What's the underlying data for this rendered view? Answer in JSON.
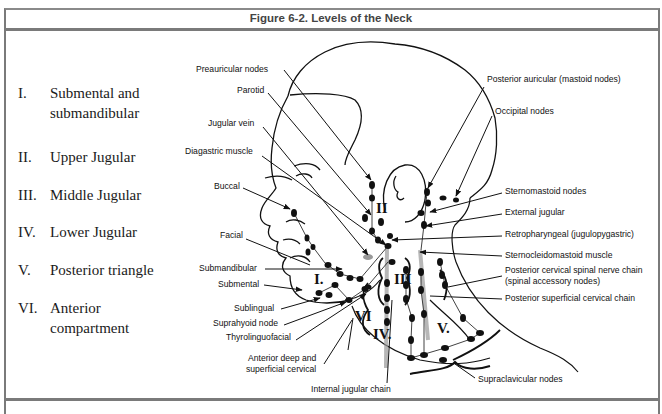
{
  "figure": {
    "title": "Figure 6-2. Levels of the Neck"
  },
  "legend": {
    "levels": [
      {
        "numeral": "I.",
        "lines": [
          "Submental and",
          "submandibular"
        ]
      },
      {
        "numeral": "II.",
        "lines": [
          "Upper Jugular"
        ]
      },
      {
        "numeral": "III.",
        "lines": [
          "Middle Jugular"
        ]
      },
      {
        "numeral": "IV.",
        "lines": [
          "Lower Jugular"
        ]
      },
      {
        "numeral": "V.",
        "lines": [
          "Posterior triangle"
        ]
      },
      {
        "numeral": "VI.",
        "lines": [
          "Anterior",
          "compartment"
        ]
      }
    ]
  },
  "diagram": {
    "left_labels": {
      "preauricular": "Preauricular nodes",
      "parotid": "Parotid",
      "jugular_vein": "Jugular vein",
      "diagastric": "Diagastric muscle",
      "buccal": "Buccal",
      "facial": "Facial",
      "submandibular": "Submandibular",
      "submental": "Submental",
      "sublingual": "Sublingual",
      "suprahyoid": "Suprahyoid node",
      "thyrolinguofacial": "Thyrolinguofacial",
      "anterior_deep_1": "Anterior deep and",
      "anterior_deep_2": "superficial cervical",
      "internal_jugular": "Internal jugular chain"
    },
    "right_labels": {
      "posterior_auricular": "Posterior auricular (mastoid nodes)",
      "occipital": "Occipital nodes",
      "sternomastoid": "Sternomastoid nodes",
      "external_jugular": "External jugular",
      "retropharyngeal": "Retropharyngeal (jugulopygastric)",
      "sternocleidomastoid": "Sternocleidomastoid muscle",
      "posterior_cervical_1": "Posterior cervical spinal nerve chain",
      "posterior_cervical_2": "(spinal accessory nodes)",
      "posterior_superficial": "Posterior superficial cervical chain",
      "supraclavicular": "Supraclavicular nodes"
    },
    "region_numerals": {
      "I": "I.",
      "II": "II",
      "III": "III",
      "IV": "IV.",
      "V": "V.",
      "VI": "VI"
    }
  }
}
